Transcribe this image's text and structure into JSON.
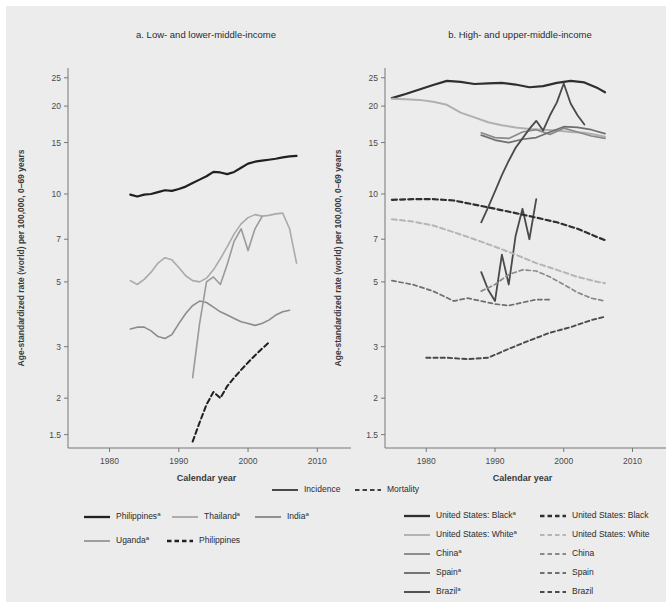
{
  "figure": {
    "background": "#ececed",
    "page_background": "#ffffff"
  },
  "panels": [
    {
      "id": "panel-a",
      "title": "a. Low- and lower-middle-income",
      "xlabel": "Calendar year",
      "ylabel": "Age-standardized rate (world) per 100,000, 0–69 years"
    },
    {
      "id": "panel-b",
      "title": "b. High- and upper-middle-income",
      "xlabel": "Calendar year",
      "ylabel": "Age-standardized rate (world) per 100,000, 0–69 years"
    }
  ],
  "axes": {
    "y_ticks": [
      25,
      20,
      15,
      10,
      7,
      5,
      3,
      2,
      1.5
    ],
    "y_tick_labels": [
      "25",
      "20",
      "15",
      "10",
      "7",
      "5",
      "3",
      "2",
      "1.5"
    ],
    "y_scale": "log",
    "ylim": [
      1.35,
      27
    ],
    "x_ticks": [
      1980,
      1990,
      2000,
      2010
    ],
    "x_tick_labels": [
      "1980",
      "1990",
      "2000",
      "2010"
    ],
    "xlim": [
      1974,
      2014
    ],
    "grid": false
  },
  "line_style_legend": {
    "items": [
      {
        "label": "Incidence",
        "style": "solid",
        "color": "#404040"
      },
      {
        "label": "Mortality",
        "style": "dashed",
        "color": "#404040"
      }
    ]
  },
  "legend_left": {
    "items": [
      {
        "label": "Philippines",
        "superscript": "a",
        "style": "solid",
        "color": "#231f20"
      },
      {
        "label": "Thailand",
        "superscript": "a",
        "style": "solid",
        "color": "#aaaaaa"
      },
      {
        "label": "India",
        "superscript": "a",
        "style": "solid",
        "color": "#8c8c8c"
      },
      {
        "label": "Uganda",
        "superscript": "a",
        "style": "solid",
        "color": "#9a9a9a"
      },
      {
        "label": "Philippines",
        "superscript": "",
        "style": "dashed",
        "color": "#231f20"
      }
    ]
  },
  "legend_right": {
    "items": [
      {
        "label": "United States: Black",
        "superscript": "a",
        "style": "solid",
        "color": "#2f2f2f"
      },
      {
        "label": "United States: Black",
        "superscript": "",
        "style": "dashed",
        "color": "#2f2f2f"
      },
      {
        "label": "United States: White",
        "superscript": "a",
        "style": "solid",
        "color": "#b0b0b0"
      },
      {
        "label": "United States: White",
        "superscript": "",
        "style": "dashed",
        "color": "#b5b5b5"
      },
      {
        "label": "China",
        "superscript": "a",
        "style": "solid",
        "color": "#8a8a8a"
      },
      {
        "label": "China",
        "superscript": "",
        "style": "dashed",
        "color": "#8a8a8a"
      },
      {
        "label": "Spain",
        "superscript": "a",
        "style": "solid",
        "color": "#6f6f6f"
      },
      {
        "label": "Spain",
        "superscript": "",
        "style": "dashed",
        "color": "#6f6f6f"
      },
      {
        "label": "Brazil",
        "superscript": "a",
        "style": "solid",
        "color": "#4a4a4a"
      },
      {
        "label": "Brazil",
        "superscript": "",
        "style": "dashed",
        "color": "#4a4a4a"
      }
    ]
  },
  "chart_data": [
    {
      "type": "line",
      "panel": "a",
      "title": "a. Low- and lower-middle-income",
      "xlabel": "Calendar year",
      "ylabel": "Age-standardized rate (world) per 100,000, 0–69 years",
      "yscale": "log",
      "ylim": [
        1.35,
        27
      ],
      "xlim": [
        1974,
        2014
      ],
      "yticks": [
        25,
        20,
        15,
        10,
        7,
        5,
        3,
        2,
        1.5
      ],
      "xticks": [
        1980,
        1990,
        2000,
        2010
      ],
      "legend_position": "below",
      "series": [
        {
          "name": "Philippines",
          "measure": "Incidence",
          "style": "solid",
          "color": "#231f20",
          "width": 2.2,
          "x": [
            1983,
            1984,
            1985,
            1986,
            1987,
            1988,
            1989,
            1990,
            1991,
            1992,
            1993,
            1994,
            1995,
            1996,
            1997,
            1998,
            1999,
            2000,
            2001,
            2002,
            2003,
            2004,
            2005,
            2006,
            2007
          ],
          "y": [
            9.95,
            9.8,
            9.95,
            10.0,
            10.15,
            10.3,
            10.25,
            10.4,
            10.6,
            10.9,
            11.2,
            11.5,
            11.9,
            11.85,
            11.7,
            11.9,
            12.3,
            12.7,
            12.9,
            13.0,
            13.1,
            13.2,
            13.35,
            13.45,
            13.5
          ]
        },
        {
          "name": "Thailand",
          "measure": "Incidence",
          "style": "solid",
          "color": "#aaaaaa",
          "width": 1.6,
          "x": [
            1983,
            1984,
            1985,
            1986,
            1987,
            1988,
            1989,
            1990,
            1991,
            1992,
            1993,
            1994,
            1995,
            1996,
            1997,
            1998,
            1999,
            2000,
            2001,
            2002,
            2003,
            2004,
            2005,
            2006,
            2007
          ],
          "y": [
            5.05,
            4.9,
            5.1,
            5.4,
            5.8,
            6.05,
            5.95,
            5.6,
            5.25,
            5.05,
            5.0,
            5.15,
            5.5,
            6.0,
            6.6,
            7.3,
            7.9,
            8.3,
            8.5,
            8.4,
            8.45,
            8.55,
            8.6,
            7.6,
            5.8
          ]
        },
        {
          "name": "India",
          "measure": "Incidence",
          "style": "solid",
          "color": "#8c8c8c",
          "width": 1.6,
          "x": [
            1983,
            1984,
            1985,
            1986,
            1987,
            1988,
            1989,
            1990,
            1991,
            1992,
            1993,
            1994,
            1995,
            1996,
            1997,
            1998,
            1999,
            2000,
            2001,
            2002,
            2003,
            2004,
            2005,
            2006
          ],
          "y": [
            3.45,
            3.5,
            3.5,
            3.4,
            3.25,
            3.2,
            3.3,
            3.6,
            3.9,
            4.15,
            4.3,
            4.25,
            4.1,
            3.95,
            3.85,
            3.75,
            3.65,
            3.6,
            3.55,
            3.6,
            3.7,
            3.85,
            3.95,
            4.0
          ]
        },
        {
          "name": "Uganda",
          "measure": "Incidence",
          "style": "solid",
          "color": "#9a9a9a",
          "width": 1.6,
          "x": [
            1992,
            1993,
            1994,
            1995,
            1996,
            1997,
            1998,
            1999,
            2000,
            2001,
            2002
          ],
          "y": [
            2.35,
            3.6,
            5.0,
            5.2,
            4.9,
            5.75,
            6.9,
            7.6,
            6.4,
            7.6,
            8.35
          ]
        },
        {
          "name": "Philippines",
          "measure": "Mortality",
          "style": "dashed",
          "color": "#231f20",
          "width": 2.0,
          "x": [
            1992,
            1993,
            1994,
            1995,
            1996,
            1997,
            1998,
            1999,
            2000,
            2001,
            2002,
            2003
          ],
          "y": [
            1.42,
            1.65,
            1.9,
            2.1,
            2.0,
            2.2,
            2.35,
            2.5,
            2.65,
            2.8,
            2.95,
            3.1
          ]
        }
      ]
    },
    {
      "type": "line",
      "panel": "b",
      "title": "b. High- and upper-middle-income",
      "xlabel": "Calendar year",
      "ylabel": "Age-standardized rate (world) per 100,000, 0–69 years",
      "yscale": "log",
      "ylim": [
        1.35,
        27
      ],
      "xlim": [
        1974,
        2014
      ],
      "yticks": [
        25,
        20,
        15,
        10,
        7,
        5,
        3,
        2,
        1.5
      ],
      "xticks": [
        1980,
        1990,
        2000,
        2010
      ],
      "legend_position": "below",
      "series": [
        {
          "name": "United States: Black",
          "measure": "Incidence",
          "style": "solid",
          "color": "#2f2f2f",
          "width": 2.2,
          "x": [
            1975,
            1977,
            1979,
            1981,
            1983,
            1985,
            1987,
            1989,
            1991,
            1993,
            1995,
            1997,
            1999,
            2001,
            2003,
            2005,
            2006
          ],
          "y": [
            21.3,
            22.0,
            22.8,
            23.6,
            24.4,
            24.2,
            23.8,
            23.9,
            24.0,
            23.7,
            23.2,
            23.4,
            24.0,
            24.4,
            24.1,
            23.0,
            22.3
          ]
        },
        {
          "name": "United States: White",
          "measure": "Incidence",
          "style": "solid",
          "color": "#b0b0b0",
          "width": 2.0,
          "x": [
            1975,
            1977,
            1979,
            1981,
            1983,
            1985,
            1987,
            1989,
            1991,
            1993,
            1995,
            1997,
            1999,
            2001,
            2003,
            2005,
            2006
          ],
          "y": [
            21.2,
            21.1,
            21.0,
            20.7,
            20.2,
            19.0,
            18.3,
            17.6,
            17.2,
            16.9,
            16.7,
            16.6,
            16.5,
            16.3,
            16.2,
            15.9,
            15.7
          ]
        },
        {
          "name": "China",
          "measure": "Incidence",
          "style": "solid",
          "color": "#8a8a8a",
          "width": 1.7,
          "x": [
            1988,
            1990,
            1992,
            1994,
            1996,
            1998,
            2000,
            2002,
            2004,
            2006
          ],
          "y": [
            16.2,
            15.6,
            15.5,
            16.3,
            16.6,
            16.0,
            16.8,
            16.3,
            15.8,
            15.5
          ]
        },
        {
          "name": "Spain",
          "measure": "Incidence",
          "style": "solid",
          "color": "#6f6f6f",
          "width": 1.7,
          "x": [
            1988,
            1990,
            1992,
            1994,
            1996,
            1998,
            2000,
            2002,
            2004,
            2006
          ],
          "y": [
            15.9,
            15.3,
            15.0,
            15.4,
            15.6,
            16.3,
            17.0,
            16.9,
            16.6,
            16.1
          ]
        },
        {
          "name": "Brazil",
          "measure": "Incidence",
          "style": "solid",
          "color": "#4a4a4a",
          "width": 1.8,
          "x": [
            1988,
            1989,
            1990,
            1991,
            1992,
            1993,
            1994,
            1995,
            1996,
            1997,
            1998,
            1999,
            2000,
            2001,
            2002,
            2003
          ],
          "y": [
            8.0,
            9.0,
            10.2,
            11.6,
            13.0,
            14.4,
            15.5,
            16.7,
            17.8,
            16.5,
            18.6,
            20.6,
            23.9,
            20.4,
            18.6,
            17.3
          ]
        },
        {
          "name": "Brazil-2",
          "measure": "Incidence",
          "style": "solid",
          "color": "#4a4a4a",
          "width": 1.8,
          "x": [
            1988,
            1989,
            1990,
            1991,
            1992,
            1993,
            1994,
            1995,
            1996
          ],
          "y": [
            5.4,
            4.7,
            4.3,
            6.2,
            4.9,
            7.2,
            8.9,
            7.0,
            9.6
          ]
        },
        {
          "name": "United States: Black",
          "measure": "Mortality",
          "style": "dashed",
          "color": "#2f2f2f",
          "width": 2.2,
          "x": [
            1975,
            1978,
            1981,
            1984,
            1987,
            1990,
            1993,
            1996,
            1999,
            2002,
            2005,
            2006
          ],
          "y": [
            9.55,
            9.6,
            9.6,
            9.5,
            9.2,
            8.9,
            8.6,
            8.3,
            8.0,
            7.6,
            7.1,
            6.95
          ]
        },
        {
          "name": "United States: White",
          "measure": "Mortality",
          "style": "dashed",
          "color": "#b5b5b5",
          "width": 2.0,
          "x": [
            1975,
            1978,
            1981,
            1984,
            1987,
            1990,
            1993,
            1996,
            1999,
            2002,
            2005,
            2006
          ],
          "y": [
            8.2,
            8.05,
            7.8,
            7.4,
            7.0,
            6.6,
            6.2,
            5.8,
            5.5,
            5.2,
            5.0,
            4.95
          ]
        },
        {
          "name": "China",
          "measure": "Mortality",
          "style": "dashed",
          "color": "#8a8a8a",
          "width": 1.7,
          "x": [
            1988,
            1990,
            1992,
            1994,
            1996,
            1998,
            2000,
            2002,
            2004,
            2006
          ],
          "y": [
            4.65,
            4.9,
            5.3,
            5.5,
            5.45,
            5.2,
            4.9,
            4.6,
            4.4,
            4.3
          ]
        },
        {
          "name": "Spain",
          "measure": "Mortality",
          "style": "dashed",
          "color": "#6f6f6f",
          "width": 1.7,
          "x": [
            1975,
            1978,
            1981,
            1984,
            1986,
            1988,
            1990,
            1992,
            1994,
            1996,
            1998
          ],
          "y": [
            5.05,
            4.9,
            4.65,
            4.3,
            4.4,
            4.3,
            4.2,
            4.15,
            4.25,
            4.35,
            4.35
          ]
        },
        {
          "name": "Brazil",
          "measure": "Mortality",
          "style": "dashed",
          "color": "#4a4a4a",
          "width": 1.9,
          "x": [
            1980,
            1983,
            1986,
            1989,
            1992,
            1995,
            1998,
            2001,
            2004,
            2006
          ],
          "y": [
            2.75,
            2.75,
            2.72,
            2.75,
            2.95,
            3.15,
            3.35,
            3.5,
            3.7,
            3.8
          ]
        }
      ]
    }
  ]
}
